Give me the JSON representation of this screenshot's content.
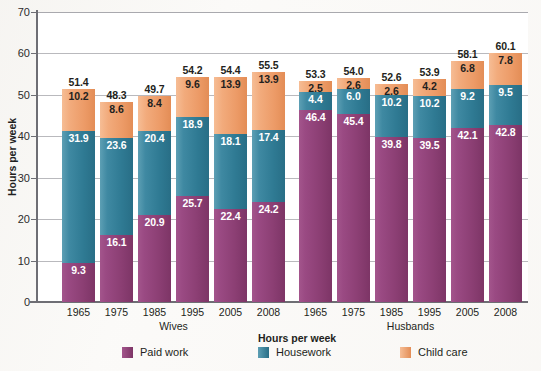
{
  "chart_data": {
    "type": "bar",
    "subtype": "stacked-bar-grouped",
    "title": "",
    "xlabel": "",
    "ylabel": "Hours per week",
    "ylim": [
      0,
      70
    ],
    "yticks": [
      0,
      10,
      20,
      30,
      40,
      50,
      60,
      70
    ],
    "grid": true,
    "legend_title": "Hours per week",
    "legend_position": "bottom",
    "categories": [
      "1965",
      "1975",
      "1985",
      "1995",
      "2005",
      "2008"
    ],
    "groups": [
      "Wives",
      "Husbands"
    ],
    "series": [
      {
        "name": "Paid work",
        "color": "#8c3f74",
        "values_wives": [
          9.3,
          16.1,
          20.9,
          25.7,
          22.4,
          24.2
        ],
        "values_husbands": [
          46.4,
          45.4,
          39.8,
          39.5,
          42.1,
          42.8
        ]
      },
      {
        "name": "Housework",
        "color": "#2f7a93",
        "values_wives": [
          31.9,
          23.6,
          20.4,
          18.9,
          18.1,
          17.4
        ],
        "values_husbands": [
          4.4,
          6.0,
          10.2,
          10.2,
          9.2,
          9.5
        ]
      },
      {
        "name": "Child care",
        "color": "#ec9a66",
        "values_wives": [
          10.2,
          8.6,
          8.4,
          9.6,
          13.9,
          13.9
        ],
        "values_husbands": [
          2.5,
          2.6,
          2.6,
          4.2,
          6.8,
          7.8
        ]
      }
    ],
    "totals_wives": [
      51.4,
      48.3,
      49.7,
      54.2,
      54.4,
      55.5
    ],
    "totals_husbands": [
      53.3,
      54.0,
      52.6,
      53.9,
      58.1,
      60.1
    ]
  },
  "axis": {
    "y_label": "Hours per week",
    "y_ticks": [
      "70",
      "60",
      "50",
      "40",
      "30",
      "20",
      "10",
      "0"
    ]
  },
  "groups": [
    {
      "name": "Wives",
      "label": "Wives",
      "bars": [
        {
          "category": "1965",
          "total": "51.4",
          "paid": "9.3",
          "housework": "31.9",
          "childcare": "10.2"
        },
        {
          "category": "1975",
          "total": "48.3",
          "paid": "16.1",
          "housework": "23.6",
          "childcare": "8.6"
        },
        {
          "category": "1985",
          "total": "49.7",
          "paid": "20.9",
          "housework": "20.4",
          "childcare": "8.4"
        },
        {
          "category": "1995",
          "total": "54.2",
          "paid": "25.7",
          "housework": "18.9",
          "childcare": "9.6"
        },
        {
          "category": "2005",
          "total": "54.4",
          "paid": "22.4",
          "housework": "18.1",
          "childcare": "13.9"
        },
        {
          "category": "2008",
          "total": "55.5",
          "paid": "24.2",
          "housework": "17.4",
          "childcare": "13.9"
        }
      ]
    },
    {
      "name": "Husbands",
      "label": "Husbands",
      "bars": [
        {
          "category": "1965",
          "total": "53.3",
          "paid": "46.4",
          "housework": "4.4",
          "childcare": "2.5"
        },
        {
          "category": "1975",
          "total": "54.0",
          "paid": "45.4",
          "housework": "6.0",
          "childcare": "2.6"
        },
        {
          "category": "1985",
          "total": "52.6",
          "paid": "39.8",
          "housework": "10.2",
          "childcare": "2.6"
        },
        {
          "category": "1995",
          "total": "53.9",
          "paid": "39.5",
          "housework": "10.2",
          "childcare": "4.2"
        },
        {
          "category": "2005",
          "total": "58.1",
          "paid": "42.1",
          "housework": "9.2",
          "childcare": "6.8"
        },
        {
          "category": "2008",
          "total": "60.1",
          "paid": "42.8",
          "housework": "9.5",
          "childcare": "7.8"
        }
      ]
    }
  ],
  "legend": {
    "title": "Hours per week",
    "items": [
      {
        "label": "Paid work",
        "color": "#8c3f74"
      },
      {
        "label": "Housework",
        "color": "#2f7a93"
      },
      {
        "label": "Child care",
        "color": "#ec9a66"
      }
    ]
  }
}
